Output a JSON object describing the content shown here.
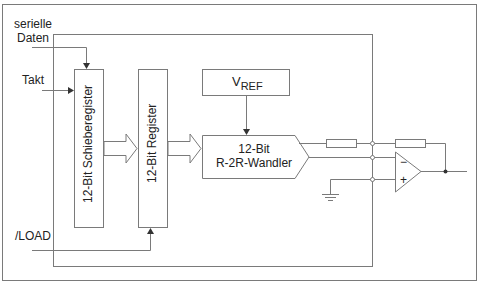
{
  "diagram": {
    "inputs": {
      "serial_data": [
        "serielle",
        "Daten"
      ],
      "clock": "Takt",
      "load": "/LOAD"
    },
    "blocks": {
      "shift_register": "12-Bit Schieberegister",
      "register": "12-Bit Register",
      "vref": {
        "main": "V",
        "sub": "REF"
      },
      "converter": [
        "12-Bit",
        "R-2R-Wandler"
      ]
    },
    "opamp": {
      "minus": "−",
      "plus": "+"
    },
    "colors": {
      "line": "#7a7a7a",
      "text": "#222222",
      "background": "#ffffff"
    }
  }
}
